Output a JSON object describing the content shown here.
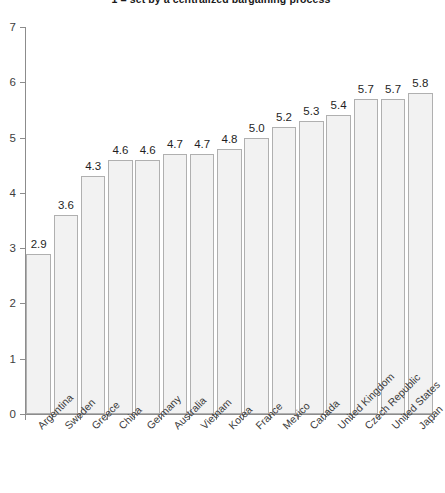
{
  "chart_data": {
    "type": "bar",
    "title": "1 = set by a centralized bargaining process",
    "xlabel": "",
    "ylabel": "",
    "ylim": [
      0,
      7
    ],
    "yticks": [
      0,
      1,
      2,
      3,
      4,
      5,
      6,
      7
    ],
    "grid": false,
    "legend": null,
    "bar_fill_color": "#f2f2f2",
    "bar_edge_color": "#b0b0b0",
    "categories": [
      "Argentina",
      "Sweden",
      "Greece",
      "China",
      "Germany",
      "Australia",
      "Vietnam",
      "Korea",
      "France",
      "Mexico",
      "Canada",
      "United Kingdom",
      "Czech Republic",
      "United States",
      "Japan"
    ],
    "values": [
      2.9,
      3.6,
      4.3,
      4.6,
      4.6,
      4.7,
      4.7,
      4.8,
      5.0,
      5.2,
      5.3,
      5.4,
      5.7,
      5.7,
      5.8
    ],
    "value_labels": [
      "2.9",
      "3.6",
      "4.3",
      "4.6",
      "4.6",
      "4.7",
      "4.7",
      "4.8",
      "5.0",
      "5.2",
      "5.3",
      "5.4",
      "5.7",
      "5.7",
      "5.8"
    ],
    "ytick_labels": [
      "0",
      "1",
      "2",
      "3",
      "4",
      "5",
      "6",
      "7"
    ]
  }
}
